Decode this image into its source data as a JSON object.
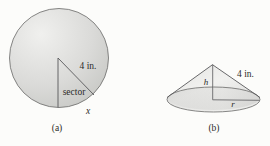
{
  "figure": {
    "part_a": {
      "radius_label": "4 in.",
      "sector_label": "sector",
      "arc_label": "x",
      "caption": "(a)"
    },
    "part_b": {
      "height_label": "h",
      "slant_label": "4 in.",
      "radius_label": "r",
      "caption": "(b)"
    }
  },
  "colors": {
    "background": "#fcfcfa",
    "shape_highlight": "#efefed",
    "shape_shadow": "#c3c4c0",
    "cone_light": "#eeeeec",
    "cone_dark": "#d3d3d1",
    "line": "#5a5a58",
    "text": "#2b2b29"
  }
}
